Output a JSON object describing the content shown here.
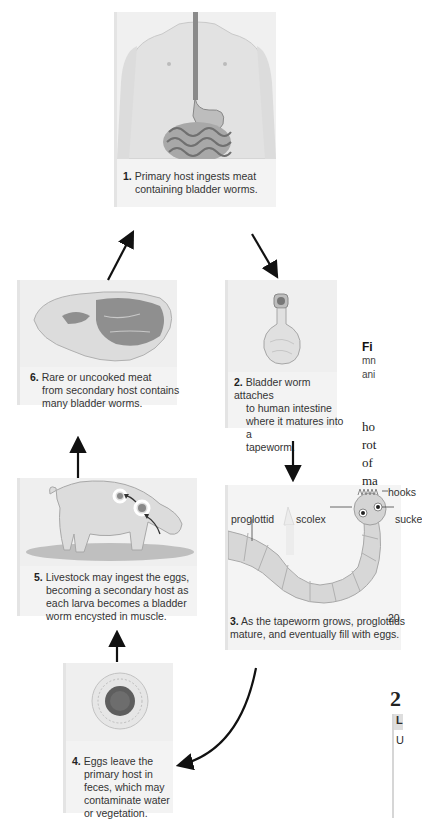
{
  "figure": {
    "steps": [
      {
        "num": "1.",
        "text": "Primary host ingests meat containing bladder worms.",
        "line1": "Primary host ingests meat",
        "line2": "containing bladder worms.",
        "image": "human-torso-digestive-system"
      },
      {
        "num": "2.",
        "text": "Bladder worm attaches to human intestine where it matures into a tapeworm.",
        "line1": "Bladder worm attaches",
        "line2": "to human intestine",
        "line3": "where it matures into a",
        "line4": "tapeworm.",
        "image": "bladder-worm"
      },
      {
        "num": "3.",
        "text": "As the tapeworm grows, proglottids mature, and eventually fill with eggs.",
        "line1": "As the tapeworm grows, proglottids",
        "line2": "mature, and eventually fill with eggs.",
        "image": "tapeworm"
      },
      {
        "num": "4.",
        "text": "Eggs leave the primary host in feces, which may contaminate water or vegetation.",
        "line1": "Eggs leave the",
        "line2": "primary host in",
        "line3": "feces, which may",
        "line4": "contaminate water",
        "line5": "or vegetation.",
        "image": "egg"
      },
      {
        "num": "5.",
        "text": "Livestock may ingest the eggs, becoming a secondary host as each larva becomes a bladder worm encysted in muscle.",
        "line1": "Livestock may ingest the eggs,",
        "line2": "becoming a secondary host as",
        "line3": "each larva becomes a bladder",
        "line4": "worm encysted in muscle.",
        "image": "pig"
      },
      {
        "num": "6.",
        "text": "Rare or uncooked meat from secondary host contains many bladder worms.",
        "line1": "Rare or uncooked meat",
        "line2": "from secondary host contains",
        "line3": "many bladder worms.",
        "image": "raw-meat"
      }
    ],
    "tapeworm_labels": {
      "proglottid": "proglottid",
      "scolex": "scolex",
      "hooks": "hooks",
      "suckers": "sucke"
    }
  },
  "side_text": {
    "caption_bold": "Fi",
    "caption_line1": "mn",
    "caption_line2": "ani",
    "body_line1": "ho",
    "body_line2": "rot",
    "body_line3": "of",
    "body_line4": "ma",
    "fragment_20": "20",
    "section_heading": "2",
    "box_header": "L",
    "box_line1": "U"
  }
}
